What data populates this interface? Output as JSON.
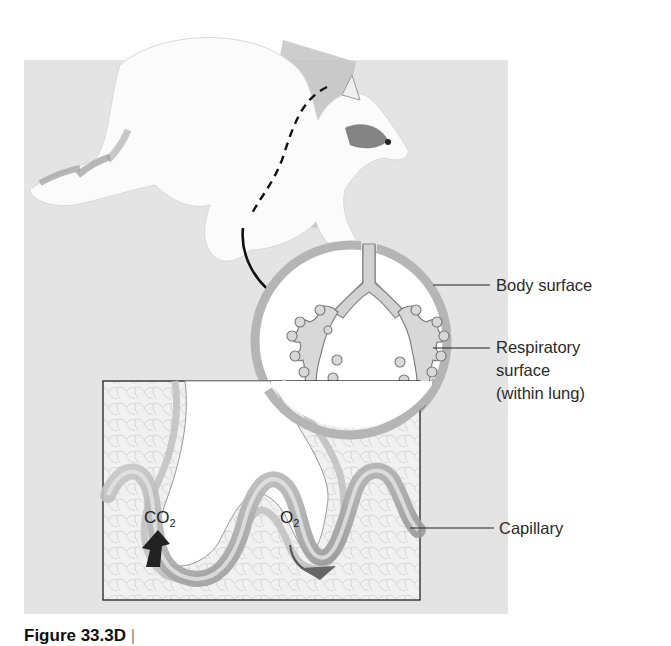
{
  "figure": {
    "caption": "Figure 33.3D",
    "caption_suffix": "Lungs"
  },
  "labels": {
    "body_surface": "Body surface",
    "respiratory_surface_1": "Respiratory",
    "respiratory_surface_2": "surface",
    "respiratory_surface_3": "(within lung)",
    "capillary": "Capillary"
  },
  "gases": {
    "co2_main": "CO",
    "co2_sub": "2",
    "o2_main": "O",
    "o2_sub": "2"
  },
  "colors": {
    "panel_bg": "#e4e4e4",
    "lung_ring": "#b5b5b5",
    "airway_fill": "#d2d2d2",
    "capillary_dark": "#8a8a8a",
    "arrow": "#111111"
  }
}
